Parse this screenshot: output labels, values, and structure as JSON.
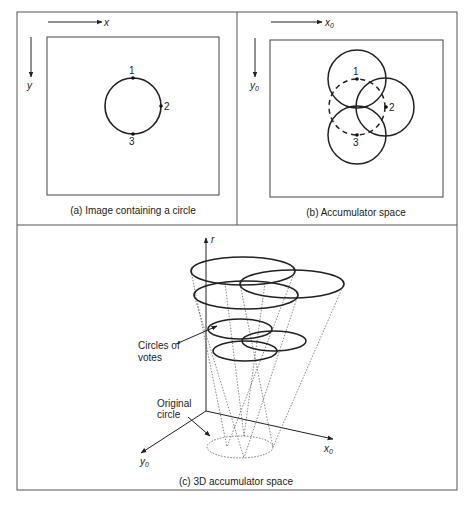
{
  "panel_a": {
    "caption": "(a) Image containing a circle",
    "x_axis_label": "x",
    "y_axis_label": "y",
    "points": [
      {
        "label": "1",
        "x": 133,
        "y": 78
      },
      {
        "label": "2",
        "x": 162,
        "y": 106
      },
      {
        "label": "3",
        "x": 133,
        "y": 133
      }
    ]
  },
  "panel_b": {
    "caption": "(b) Accumulator space",
    "x_axis_label": "x",
    "x_axis_sub": "0",
    "y_axis_label": "y",
    "y_axis_sub": "0",
    "points": [
      {
        "label": "1",
        "x": 357,
        "y": 79
      },
      {
        "label": "2",
        "x": 386,
        "y": 107
      },
      {
        "label": "3",
        "x": 357,
        "y": 135
      }
    ]
  },
  "panel_c": {
    "caption": "(c) 3D accumulator space",
    "r_axis_label": "r",
    "x_axis_label": "x",
    "x_axis_sub": "0",
    "y_axis_label": "y",
    "y_axis_sub": "0",
    "circles_of_votes_label_line1": "Circles of",
    "circles_of_votes_label_line2": "votes",
    "original_circle_label_line1": "Original",
    "original_circle_label_line2": "circle"
  },
  "colors": {
    "line": "#222222",
    "frame": "#555555",
    "background": "#ffffff"
  }
}
